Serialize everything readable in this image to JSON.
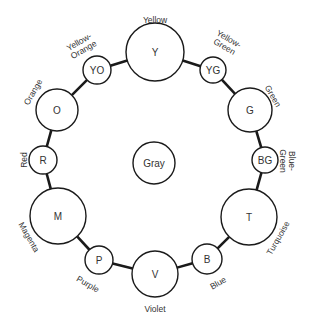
{
  "center": {
    "abbr": "Gray",
    "name": "Gray",
    "cx": 154,
    "cy": 163,
    "r": 21
  },
  "colors": [
    {
      "abbr": "Y",
      "name": "Yellow",
      "cx": 155,
      "cy": 52,
      "r": 29
    },
    {
      "abbr": "YG",
      "name": "Yellow-Green",
      "cx": 213,
      "cy": 70,
      "r": 13
    },
    {
      "abbr": "G",
      "name": "Green",
      "cx": 250,
      "cy": 110,
      "r": 22
    },
    {
      "abbr": "BG",
      "name": "Blue-Green",
      "cx": 265,
      "cy": 160,
      "r": 13
    },
    {
      "abbr": "T",
      "name": "Turquoise",
      "cx": 249,
      "cy": 217,
      "r": 28
    },
    {
      "abbr": "B",
      "name": "Blue",
      "cx": 207,
      "cy": 259,
      "r": 15
    },
    {
      "abbr": "V",
      "name": "Violet",
      "cx": 155,
      "cy": 274,
      "r": 23
    },
    {
      "abbr": "P",
      "name": "Purple",
      "cx": 99,
      "cy": 260,
      "r": 14
    },
    {
      "abbr": "M",
      "name": "Magenta",
      "cx": 58,
      "cy": 216,
      "r": 28
    },
    {
      "abbr": "R",
      "name": "Red",
      "cx": 43,
      "cy": 160,
      "r": 14
    },
    {
      "abbr": "O",
      "name": "Orange",
      "cx": 57,
      "cy": 110,
      "r": 21
    },
    {
      "abbr": "YO",
      "name": "Yellow-Orange",
      "cx": 97,
      "cy": 70,
      "r": 14
    }
  ],
  "labels": {
    "Y": {
      "lines": [
        "Yellow"
      ],
      "x": 155,
      "y": 20,
      "rot": 0
    },
    "YG": {
      "lines": [
        "Yellow-",
        "Green"
      ],
      "x": 226,
      "y": 44,
      "rot": 30
    },
    "G": {
      "lines": [
        "Green"
      ],
      "x": 273,
      "y": 96,
      "rot": 60
    },
    "BG": {
      "lines": [
        "Blue-",
        "Green"
      ],
      "x": 286,
      "y": 161,
      "rot": 90
    },
    "T": {
      "lines": [
        "Turquoise"
      ],
      "x": 278,
      "y": 238,
      "rot": -60
    },
    "B": {
      "lines": [
        "Blue"
      ],
      "x": 218,
      "y": 283,
      "rot": -30
    },
    "V": {
      "lines": [
        "Violet"
      ],
      "x": 155,
      "y": 309,
      "rot": 0
    },
    "P": {
      "lines": [
        "Purple"
      ],
      "x": 88,
      "y": 284,
      "rot": 30
    },
    "M": {
      "lines": [
        "Magenta"
      ],
      "x": 29,
      "y": 237,
      "rot": 60
    },
    "R": {
      "lines": [
        "Red"
      ],
      "x": 24,
      "y": 160,
      "rot": -90
    },
    "O": {
      "lines": [
        "Orange"
      ],
      "x": 33,
      "y": 92,
      "rot": -60
    },
    "YO": {
      "lines": [
        "Yellow-",
        "Orange"
      ],
      "x": 82,
      "y": 47,
      "rot": -30
    }
  }
}
